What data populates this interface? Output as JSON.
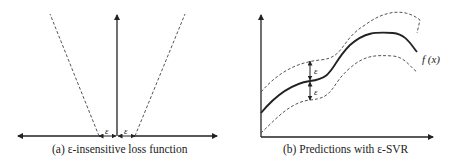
{
  "panel_a": {
    "caption": "(a) ε-insensitive loss function",
    "epsilon_left": "ε",
    "epsilon_right": "ε"
  },
  "panel_b": {
    "caption": "(b) Predictions with ε-SVR",
    "function_label": "f (x)",
    "epsilon_upper": "ε",
    "epsilon_lower": "ε"
  },
  "colors": {
    "line": "#222222",
    "dashed": "#555555",
    "background": "#ffffff"
  }
}
